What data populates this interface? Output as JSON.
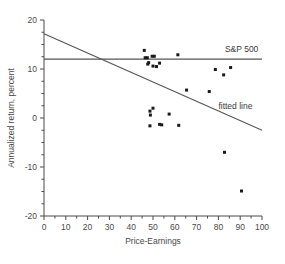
{
  "chart_data": {
    "type": "scatter",
    "title": "",
    "xlabel": "Price-Earnings",
    "ylabel": "Annualized return, percent",
    "xlim": [
      0,
      100
    ],
    "ylim": [
      -20,
      20
    ],
    "xticks": [
      0,
      10,
      20,
      30,
      40,
      50,
      60,
      70,
      80,
      90,
      100
    ],
    "xticklabels": [
      "0",
      "10",
      "20",
      "30",
      "40",
      "50",
      "60",
      "70",
      "80",
      "90",
      "100"
    ],
    "yticks": [
      -20,
      -10,
      0,
      10,
      20
    ],
    "yticklabels": [
      "-20",
      "-10",
      "0",
      "10",
      "20"
    ],
    "minor_ticks": true,
    "grid": false,
    "legend_position": "inline-annotation",
    "marker_color": "#1a1a1a",
    "line_color": "#555555",
    "series": [
      {
        "name": "stocks",
        "type": "scatter",
        "points": [
          {
            "x": 46.0,
            "y": 13.8
          },
          {
            "x": 46.4,
            "y": 12.3
          },
          {
            "x": 47.4,
            "y": 12.3
          },
          {
            "x": 47.6,
            "y": 11.0
          },
          {
            "x": 48.0,
            "y": 11.3
          },
          {
            "x": 49.6,
            "y": 12.6
          },
          {
            "x": 50.6,
            "y": 12.6
          },
          {
            "x": 50.0,
            "y": 10.6
          },
          {
            "x": 51.6,
            "y": 10.5
          },
          {
            "x": 53.0,
            "y": 11.2
          },
          {
            "x": 61.4,
            "y": 12.9
          },
          {
            "x": 48.6,
            "y": 1.4
          },
          {
            "x": 50.0,
            "y": 2.0
          },
          {
            "x": 48.8,
            "y": 0.6
          },
          {
            "x": 48.6,
            "y": -1.6
          },
          {
            "x": 53.0,
            "y": -1.3
          },
          {
            "x": 54.0,
            "y": -1.4
          },
          {
            "x": 57.4,
            "y": 0.8
          },
          {
            "x": 61.8,
            "y": -1.5
          },
          {
            "x": 65.4,
            "y": 5.7
          },
          {
            "x": 75.8,
            "y": 5.4
          },
          {
            "x": 78.6,
            "y": 9.9
          },
          {
            "x": 82.4,
            "y": 8.8
          },
          {
            "x": 85.6,
            "y": 10.3
          },
          {
            "x": 82.8,
            "y": -7.0
          },
          {
            "x": 90.6,
            "y": -14.9
          }
        ]
      }
    ],
    "reference_lines": [
      {
        "name": "S&P 500",
        "label": "S&P 500",
        "orientation": "horizontal",
        "y": 12.0,
        "x_start": 0,
        "x_end": 100
      },
      {
        "name": "fitted line",
        "label": "fitted line",
        "orientation": "diagonal",
        "x_start": 0,
        "y_start": 17.2,
        "x_end": 100,
        "y_end": -2.5
      }
    ],
    "annotations": [
      {
        "text": "S&P 500",
        "x": 83,
        "y": 13.4
      },
      {
        "text": "fitted line",
        "x": 80,
        "y": 1.9
      }
    ]
  }
}
